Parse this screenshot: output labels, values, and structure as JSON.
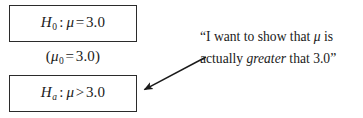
{
  "figure": {
    "background_color": "#ffffff",
    "ink_color": "#1a1a1a",
    "border_color": "#2b2b2b"
  },
  "null_hypothesis": {
    "symbol": "H",
    "subscript": "0",
    "separator": ":",
    "parameter": "μ",
    "operator": "=",
    "value": "3.0",
    "full_text": "H₀ : μ = 3.0"
  },
  "parameter_note": {
    "open_paren": "(",
    "parameter": "μ",
    "subscript": "0",
    "operator": "=",
    "value": "3.0",
    "close_paren": ")",
    "full_text": "(μ₀ = 3.0)"
  },
  "alternative_hypothesis": {
    "symbol": "H",
    "subscript": "a",
    "separator": ":",
    "parameter": "μ",
    "operator": ">",
    "value": "3.0",
    "full_text": "Hₐ : μ > 3.0"
  },
  "annotation": {
    "open_quote": "“",
    "line1_before_mu": "I want to show that ",
    "parameter": "μ",
    "line1_after_mu": " is",
    "line2_before_em": "actually ",
    "emphasis": "greater",
    "line2_after_em": " that 3.0",
    "close_quote": "”",
    "full_text": "“I want to show that μ is actually greater that 3.0”"
  },
  "arrow": {
    "label": "annotation-pointer",
    "from_x": 206,
    "from_y": 57,
    "to_x": 140,
    "to_y": 92,
    "color": "#1a1a1a"
  }
}
